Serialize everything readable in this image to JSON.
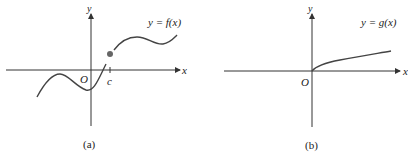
{
  "panels": [
    {
      "id": "a",
      "caption": "(a)",
      "function_label": "y = f(x)",
      "x_axis_label": "x",
      "y_axis_label": "y",
      "origin_label": "O",
      "point_label": "c",
      "description": "Function with a jump discontinuity at x = c; filled dot marks f(c)"
    },
    {
      "id": "b",
      "caption": "(b)",
      "function_label": "y = g(x)",
      "x_axis_label": "x",
      "y_axis_label": "y",
      "origin_label": "O",
      "description": "Function defined for x >= 0, starting at origin and increasing (square-root-like)"
    }
  ],
  "colors": {
    "axis": "#333333",
    "curve": "#444444",
    "dot": "#666666"
  }
}
